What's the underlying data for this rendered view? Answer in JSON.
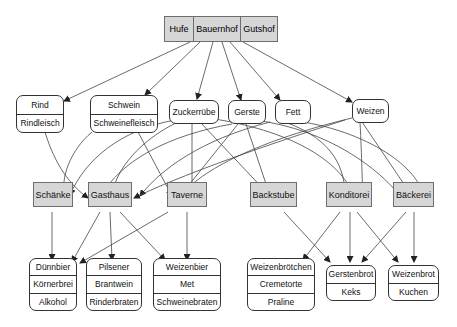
{
  "diagram": {
    "type": "directed-graph",
    "top_node": {
      "parts": [
        "Hufe",
        "Bauernhof",
        "Gutshof"
      ]
    },
    "sources": [
      {
        "id": "rind",
        "items": [
          "Rind",
          "Rindleisch"
        ]
      },
      {
        "id": "schwein",
        "items": [
          "Schwein",
          "Schweinefleisch"
        ]
      },
      {
        "id": "zuckerruebe",
        "items": [
          "Zuckerrübe"
        ]
      },
      {
        "id": "gerste",
        "items": [
          "Gerste"
        ]
      },
      {
        "id": "fett",
        "items": [
          "Fett"
        ]
      },
      {
        "id": "weizen",
        "items": [
          "Weizen"
        ]
      }
    ],
    "processors": [
      {
        "id": "schaenke",
        "label": "Schänke"
      },
      {
        "id": "gasthaus",
        "label": "Gasthaus"
      },
      {
        "id": "taverne",
        "label": "Taverne"
      },
      {
        "id": "backstube",
        "label": "Backstube"
      },
      {
        "id": "konditorei",
        "label": "Konditorei"
      },
      {
        "id": "baeckerei",
        "label": "Bäckerei"
      }
    ],
    "products": [
      {
        "id": "p1",
        "items": [
          "Dünnbier",
          "Körnerbrei",
          "Alkohol"
        ]
      },
      {
        "id": "p2",
        "items": [
          "Pilsener",
          "Brantwein",
          "Rinderbraten"
        ]
      },
      {
        "id": "p3",
        "items": [
          "Weizenbier",
          "Met",
          "Schweinebraten"
        ]
      },
      {
        "id": "p4",
        "items": [
          "Weizenbrötchen",
          "Cremetorte",
          "Praline"
        ]
      },
      {
        "id": "p5",
        "items": [
          "Gerstenbrot",
          "Keks"
        ]
      },
      {
        "id": "p6",
        "items": [
          "Weizenbrot",
          "Kuchen"
        ]
      }
    ],
    "colors": {
      "processor_fill": "#d6d6d6",
      "edge": "#333333",
      "node_border": "#333333"
    }
  }
}
